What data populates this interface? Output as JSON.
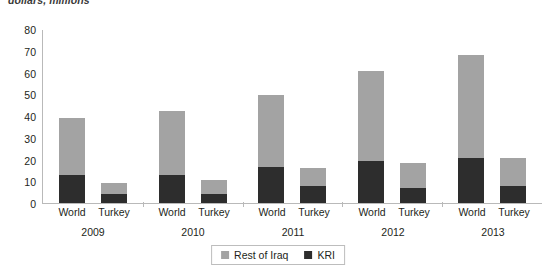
{
  "units_caption": "dollars, millions",
  "chart_data": {
    "type": "bar",
    "subtype": "stacked-grouped-column",
    "title": "",
    "subtitle": "",
    "units_label": "dollars, millions",
    "xlabel": "",
    "ylabel": "",
    "ylim": [
      0,
      80
    ],
    "yticks": [
      80,
      70,
      60,
      50,
      40,
      30,
      20,
      10,
      0
    ],
    "ytick_labels": [
      "80",
      "70",
      "60",
      "50",
      "40",
      "30",
      "20",
      "10",
      "0"
    ],
    "grid": false,
    "legend_position": "bottom-center",
    "categories": [
      "2009",
      "2010",
      "2011",
      "2012",
      "2013"
    ],
    "subcategories": [
      "World",
      "Turkey"
    ],
    "series": [
      {
        "name": "Rest of Iraq",
        "color": "#a3a3a3",
        "values": {
          "World": [
            26.0,
            29.5,
            33.0,
            41.0,
            47.5
          ],
          "Turkey": [
            5.0,
            6.5,
            8.0,
            11.5,
            12.5
          ]
        }
      },
      {
        "name": "KRI",
        "color": "#2d2d2d",
        "values": {
          "World": [
            13.0,
            13.0,
            16.5,
            19.5,
            20.5
          ],
          "Turkey": [
            4.0,
            4.0,
            8.0,
            7.0,
            8.0
          ]
        }
      }
    ],
    "totals": {
      "World": [
        39.0,
        42.5,
        49.5,
        60.5,
        68.0
      ],
      "Turkey": [
        9.0,
        10.5,
        16.0,
        18.5,
        20.5
      ]
    },
    "groups": [
      {
        "year": "2009",
        "bars": [
          {
            "label": "World",
            "kri": 13.0,
            "rest_of_iraq": 26.0,
            "total": 39.0
          },
          {
            "label": "Turkey",
            "kri": 4.0,
            "rest_of_iraq": 5.0,
            "total": 9.0
          }
        ]
      },
      {
        "year": "2010",
        "bars": [
          {
            "label": "World",
            "kri": 13.0,
            "rest_of_iraq": 29.5,
            "total": 42.5
          },
          {
            "label": "Turkey",
            "kri": 4.0,
            "rest_of_iraq": 6.5,
            "total": 10.5
          }
        ]
      },
      {
        "year": "2011",
        "bars": [
          {
            "label": "World",
            "kri": 16.5,
            "rest_of_iraq": 33.0,
            "total": 49.5
          },
          {
            "label": "Turkey",
            "kri": 8.0,
            "rest_of_iraq": 8.0,
            "total": 16.0
          }
        ]
      },
      {
        "year": "2012",
        "bars": [
          {
            "label": "World",
            "kri": 19.5,
            "rest_of_iraq": 41.0,
            "total": 60.5
          },
          {
            "label": "Turkey",
            "kri": 7.0,
            "rest_of_iraq": 11.5,
            "total": 18.5
          }
        ]
      },
      {
        "year": "2013",
        "bars": [
          {
            "label": "World",
            "kri": 20.5,
            "rest_of_iraq": 47.5,
            "total": 68.0
          },
          {
            "label": "Turkey",
            "kri": 8.0,
            "rest_of_iraq": 12.5,
            "total": 20.5
          }
        ]
      }
    ],
    "legend": [
      {
        "label": "Rest of Iraq",
        "color": "#a3a3a3"
      },
      {
        "label": "KRI",
        "color": "#2d2d2d"
      }
    ]
  },
  "colors": {
    "rest_of_iraq": "#a3a3a3",
    "kri": "#2d2d2d",
    "axis": "#b9b9b9",
    "text": "#231f20",
    "background": "#ffffff"
  }
}
